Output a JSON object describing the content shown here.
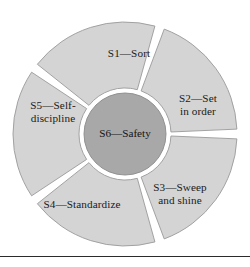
{
  "figure": {
    "name": "5S plus Safety wheel diagram",
    "colors": {
      "segment_fill": "#d4d4d4",
      "segment_stroke": "#9a9a9a",
      "center_fill": "#a8a8a8",
      "center_stroke": "#8a8a8a",
      "gap": "#ffffff",
      "text": "#1a1a1a",
      "rule": "#2b2b2b",
      "background": "#ffffff"
    },
    "geometry": {
      "center_x": 125,
      "center_y": 134,
      "outer_radius": 112,
      "inner_radius": 46,
      "hub_radius": 41,
      "gap_degrees": 5
    },
    "center": {
      "label": "S6—Safety"
    },
    "segments": [
      {
        "id": "s1",
        "label": "S1—Sort",
        "lines": [
          "S1—Sort"
        ],
        "start_angle": -54,
        "end_angle": 18,
        "label_x": 129,
        "label_y": 54
      },
      {
        "id": "s2",
        "label": "S2—Set in order",
        "lines": [
          "S2—Set",
          "in order"
        ],
        "start_angle": 18,
        "end_angle": 90,
        "label_x": 198,
        "label_y": 105
      },
      {
        "id": "s3",
        "label": "S3—Sweep and shine",
        "lines": [
          "S3—Sweep",
          "and shine"
        ],
        "start_angle": 90,
        "end_angle": 162,
        "label_x": 180,
        "label_y": 194
      },
      {
        "id": "s4",
        "label": "S4—Standardize",
        "lines": [
          "S4—Standardize"
        ],
        "start_angle": 162,
        "end_angle": 234,
        "label_x": 82,
        "label_y": 205
      },
      {
        "id": "s5",
        "label": "S5—Self-discipline",
        "lines": [
          "S5—Self-",
          "discipline"
        ],
        "start_angle": 234,
        "end_angle": 306,
        "label_x": 53,
        "label_y": 112
      }
    ],
    "rule": {
      "label": "horizontal separator rule"
    }
  }
}
